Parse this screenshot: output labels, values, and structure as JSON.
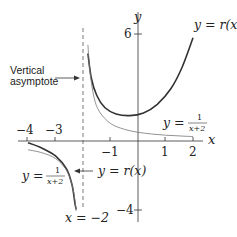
{
  "figure": {
    "annotations": {
      "asymptote_label_line1": "Vertical",
      "asymptote_label_line2": "asymptote",
      "asymptote_eq": "x = −2",
      "r_label_top": "y = r(x)",
      "r_label_bottom": "y = r(x)",
      "recip_label_right_lhs": "y =",
      "recip_label_left_lhs": "y =",
      "recip_num": "1",
      "recip_den": "x+2"
    },
    "axes": {
      "x_label": "x",
      "y_label": "y",
      "x_ticks": [
        "−4",
        "−3",
        "−1",
        "1",
        "2"
      ],
      "y_ticks": [
        "6",
        "−4"
      ]
    }
  },
  "chart_data": {
    "type": "line",
    "title": "",
    "xlabel": "x",
    "ylabel": "y",
    "xlim": [
      -4.2,
      2.6
    ],
    "ylim": [
      -4.6,
      7.8
    ],
    "grid": false,
    "vertical_asymptote": -2,
    "x_ticks": [
      -4,
      -3,
      -1,
      1,
      2
    ],
    "y_ticks": [
      6,
      -4
    ],
    "series": [
      {
        "name": "y = r(x)",
        "style": "thick",
        "branches": [
          [
            [
              -4.0,
              -0.1
            ],
            [
              -3.5,
              -0.4
            ],
            [
              -3.0,
              -0.85
            ],
            [
              -2.6,
              -1.6
            ],
            [
              -2.4,
              -2.5
            ],
            [
              -2.3,
              -3.5
            ],
            [
              -2.25,
              -3.9
            ]
          ],
          [
            [
              -1.82,
              5.0
            ],
            [
              -1.7,
              3.6
            ],
            [
              -1.5,
              2.6
            ],
            [
              -1.2,
              1.9
            ],
            [
              -0.8,
              1.55
            ],
            [
              -0.3,
              1.45
            ],
            [
              0.2,
              1.6
            ],
            [
              0.7,
              2.1
            ],
            [
              1.2,
              3.0
            ],
            [
              1.6,
              4.2
            ],
            [
              2.0,
              5.9
            ]
          ]
        ]
      },
      {
        "name": "y = 1/(x+2)",
        "style": "thin",
        "branches": [
          [
            [
              -4.0,
              -0.5
            ],
            [
              -3.5,
              -0.67
            ],
            [
              -3.0,
              -1.0
            ],
            [
              -2.6,
              -1.67
            ],
            [
              -2.4,
              -2.5
            ],
            [
              -2.3,
              -3.33
            ],
            [
              -2.25,
              -4.0
            ]
          ],
          [
            [
              -1.82,
              5.5
            ],
            [
              -1.75,
              4.0
            ],
            [
              -1.6,
              2.5
            ],
            [
              -1.4,
              1.67
            ],
            [
              -1.0,
              1.0
            ],
            [
              -0.5,
              0.67
            ],
            [
              0.0,
              0.5
            ],
            [
              0.5,
              0.4
            ],
            [
              1.0,
              0.33
            ],
            [
              1.5,
              0.29
            ],
            [
              2.0,
              0.25
            ]
          ]
        ]
      }
    ]
  }
}
